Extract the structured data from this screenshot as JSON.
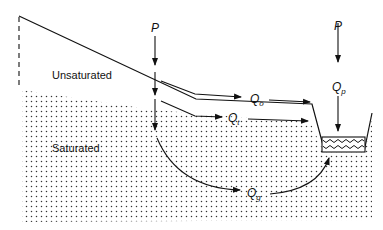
{
  "diagram": {
    "type": "hillslope-runoff-cross-section",
    "regions": {
      "unsaturated": "Unsaturated",
      "saturated": "Saturated"
    },
    "inputs": [
      {
        "id": "precip-hillslope",
        "label": "P"
      },
      {
        "id": "precip-channel",
        "label": "P"
      }
    ],
    "flows": [
      {
        "id": "overland",
        "symbol": "Q",
        "subscript": "o"
      },
      {
        "id": "throughflow",
        "symbol": "Q",
        "subscript": "t"
      },
      {
        "id": "groundwater",
        "symbol": "Q",
        "subscript": "g"
      },
      {
        "id": "channel-precip",
        "symbol": "Q",
        "subscript": "p"
      }
    ],
    "colors": {
      "line": "#111111",
      "stipple": "#333333",
      "background": "#ffffff"
    }
  }
}
